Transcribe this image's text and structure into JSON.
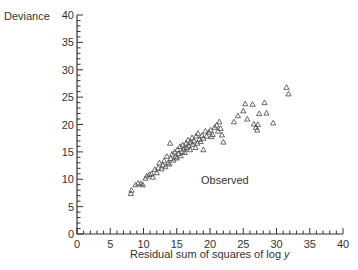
{
  "chart_data": {
    "type": "scatter",
    "title": "",
    "xlabel": "Residual sum of squares of log y",
    "ylabel": "Deviance",
    "xlim": [
      0,
      40
    ],
    "ylim": [
      0,
      40
    ],
    "x_ticks": [
      0,
      5,
      10,
      15,
      20,
      25,
      30,
      35,
      40
    ],
    "y_ticks": [
      0,
      5,
      10,
      15,
      20,
      25,
      30,
      35,
      40
    ],
    "minor_tick_step": 1,
    "grid": false,
    "legend": null,
    "marker": "open-triangle",
    "annotations": [
      {
        "text": "Observed",
        "x": 21,
        "y": 10
      }
    ],
    "series": [
      {
        "name": "Observed",
        "points": [
          [
            8.1,
            7.4
          ],
          [
            8.2,
            8.0
          ],
          [
            8.8,
            9.0
          ],
          [
            9.2,
            9.3
          ],
          [
            9.6,
            9.2
          ],
          [
            9.9,
            9.0
          ],
          [
            10.3,
            10.2
          ],
          [
            10.5,
            10.6
          ],
          [
            10.9,
            10.9
          ],
          [
            11.2,
            11.0
          ],
          [
            11.4,
            10.4
          ],
          [
            11.7,
            11.8
          ],
          [
            12.0,
            11.2
          ],
          [
            12.2,
            12.1
          ],
          [
            12.4,
            13.0
          ],
          [
            12.7,
            11.9
          ],
          [
            12.9,
            12.6
          ],
          [
            13.1,
            13.4
          ],
          [
            13.3,
            12.3
          ],
          [
            13.5,
            14.2
          ],
          [
            13.7,
            13.0
          ],
          [
            13.9,
            12.8
          ],
          [
            14.1,
            13.8
          ],
          [
            14.3,
            14.6
          ],
          [
            14.5,
            13.5
          ],
          [
            14.7,
            15.0
          ],
          [
            14.8,
            14.1
          ],
          [
            15.0,
            13.9
          ],
          [
            15.1,
            15.4
          ],
          [
            15.3,
            14.7
          ],
          [
            15.5,
            16.0
          ],
          [
            15.6,
            14.3
          ],
          [
            15.8,
            15.1
          ],
          [
            15.9,
            16.3
          ],
          [
            16.1,
            15.5
          ],
          [
            16.2,
            14.9
          ],
          [
            16.4,
            16.6
          ],
          [
            16.5,
            15.8
          ],
          [
            16.7,
            17.2
          ],
          [
            16.8,
            16.1
          ],
          [
            17.0,
            15.4
          ],
          [
            17.1,
            16.8
          ],
          [
            17.3,
            17.6
          ],
          [
            17.4,
            16.4
          ],
          [
            17.6,
            17.0
          ],
          [
            17.8,
            15.8
          ],
          [
            17.9,
            17.9
          ],
          [
            18.1,
            16.6
          ],
          [
            18.2,
            18.4
          ],
          [
            18.4,
            17.3
          ],
          [
            18.6,
            16.9
          ],
          [
            18.8,
            18.0
          ],
          [
            19.0,
            17.5
          ],
          [
            19.3,
            18.8
          ],
          [
            19.5,
            17.9
          ],
          [
            19.8,
            18.6
          ],
          [
            20.1,
            19.0
          ],
          [
            20.4,
            18.2
          ],
          [
            20.7,
            19.5
          ],
          [
            21.0,
            19.9
          ],
          [
            21.2,
            18.8
          ],
          [
            21.4,
            20.5
          ],
          [
            21.6,
            19.3
          ],
          [
            21.8,
            18.1
          ],
          [
            22.0,
            16.8
          ],
          [
            14.0,
            16.6
          ],
          [
            19.0,
            15.4
          ],
          [
            20.2,
            17.8
          ],
          [
            23.6,
            20.5
          ],
          [
            24.2,
            21.6
          ],
          [
            25.0,
            22.5
          ],
          [
            25.3,
            23.8
          ],
          [
            25.6,
            21.0
          ],
          [
            26.4,
            23.7
          ],
          [
            26.6,
            20.1
          ],
          [
            26.9,
            19.5
          ],
          [
            27.2,
            20.0
          ],
          [
            27.4,
            22.0
          ],
          [
            28.2,
            24.0
          ],
          [
            28.5,
            22.1
          ],
          [
            29.5,
            20.3
          ],
          [
            31.5,
            26.8
          ],
          [
            31.8,
            25.6
          ],
          [
            27.1,
            19.0
          ]
        ]
      }
    ],
    "caption_partial": "…Weibull…Monte Carlo…"
  },
  "axes": {
    "ylabel": "Deviance",
    "xlabel_main": "Residual sum of squares of log ",
    "xlabel_italic": "y"
  },
  "annotation": "Observed"
}
